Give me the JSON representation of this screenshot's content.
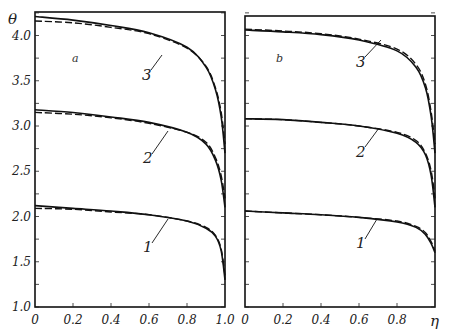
{
  "chart_data": [
    {
      "type": "line",
      "panel_label": "a",
      "xlabel": "",
      "ylabel": "θ",
      "xlim": [
        0,
        1.0
      ],
      "ylim": [
        1.0,
        4.3
      ],
      "x_ticks": [
        "0",
        "0.2",
        "0.4",
        "0.6",
        "0.8",
        "1.0"
      ],
      "y_ticks": [
        "1.0",
        "1.5",
        "2.0",
        "2.5",
        "3.0",
        "3.5",
        "4.0"
      ],
      "grid": false,
      "series": [
        {
          "name": "1 (solid)",
          "style": "solid",
          "x": [
            0,
            0.2,
            0.4,
            0.6,
            0.8,
            0.9,
            0.95,
            0.98,
            1.0
          ],
          "y": [
            2.12,
            2.09,
            2.06,
            2.02,
            1.95,
            1.87,
            1.78,
            1.62,
            1.3
          ]
        },
        {
          "name": "1 (dashed)",
          "style": "dashed",
          "x": [
            0,
            0.2,
            0.4,
            0.6,
            0.8,
            0.9,
            0.95,
            0.98,
            1.0
          ],
          "y": [
            2.09,
            2.08,
            2.05,
            2.02,
            1.95,
            1.88,
            1.79,
            1.64,
            1.35
          ]
        },
        {
          "name": "2 (solid)",
          "style": "solid",
          "x": [
            0,
            0.2,
            0.4,
            0.6,
            0.8,
            0.9,
            0.95,
            0.98,
            1.0
          ],
          "y": [
            3.18,
            3.15,
            3.1,
            3.04,
            2.93,
            2.8,
            2.62,
            2.4,
            2.1
          ]
        },
        {
          "name": "2 (dashed)",
          "style": "dashed",
          "x": [
            0,
            0.2,
            0.4,
            0.6,
            0.8,
            0.9,
            0.95,
            0.98,
            1.0
          ],
          "y": [
            3.15,
            3.13,
            3.09,
            3.03,
            2.93,
            2.82,
            2.65,
            2.45,
            2.2
          ]
        },
        {
          "name": "3 (solid)",
          "style": "solid",
          "x": [
            0,
            0.2,
            0.4,
            0.6,
            0.8,
            0.9,
            0.95,
            0.98,
            1.0
          ],
          "y": [
            4.21,
            4.17,
            4.11,
            4.03,
            3.87,
            3.65,
            3.4,
            3.1,
            2.7
          ]
        },
        {
          "name": "3 (dashed)",
          "style": "dashed",
          "x": [
            0,
            0.2,
            0.4,
            0.6,
            0.8,
            0.9,
            0.95,
            0.98,
            1.0
          ],
          "y": [
            4.16,
            4.14,
            4.09,
            4.02,
            3.86,
            3.66,
            3.42,
            3.15,
            2.8
          ]
        }
      ],
      "annotations": [
        "1",
        "2",
        "3",
        "a"
      ]
    },
    {
      "type": "line",
      "panel_label": "b",
      "xlabel": "η",
      "ylabel": "",
      "xlim": [
        0,
        1.0
      ],
      "ylim": [
        1.0,
        4.3
      ],
      "x_ticks": [
        "0",
        "0.2",
        "0.4",
        "0.6",
        "0.8"
      ],
      "y_ticks": [
        "1.0",
        "1.5",
        "2.0",
        "2.5",
        "3.0",
        "3.5",
        "4.0"
      ],
      "grid": false,
      "series": [
        {
          "name": "1 (solid)",
          "style": "solid",
          "x": [
            0,
            0.2,
            0.4,
            0.6,
            0.8,
            0.9,
            0.95,
            0.98,
            1.0
          ],
          "y": [
            2.06,
            2.04,
            2.02,
            1.99,
            1.94,
            1.88,
            1.8,
            1.7,
            1.6
          ]
        },
        {
          "name": "1 (dashed)",
          "style": "dashed",
          "x": [
            0,
            0.2,
            0.4,
            0.6,
            0.8,
            0.9,
            0.95,
            0.98,
            1.0
          ],
          "y": [
            2.06,
            2.04,
            2.02,
            1.99,
            1.95,
            1.89,
            1.82,
            1.72,
            1.62
          ]
        },
        {
          "name": "2 (solid)",
          "style": "solid",
          "x": [
            0,
            0.2,
            0.4,
            0.6,
            0.8,
            0.9,
            0.95,
            0.98,
            1.0
          ],
          "y": [
            3.08,
            3.07,
            3.04,
            3.0,
            2.92,
            2.82,
            2.68,
            2.45,
            2.1
          ]
        },
        {
          "name": "2 (dashed)",
          "style": "dashed",
          "x": [
            0,
            0.2,
            0.4,
            0.6,
            0.8,
            0.9,
            0.95,
            0.98,
            1.0
          ],
          "y": [
            3.08,
            3.07,
            3.04,
            3.0,
            2.93,
            2.84,
            2.7,
            2.5,
            2.2
          ]
        },
        {
          "name": "3 (solid)",
          "style": "solid",
          "x": [
            0,
            0.2,
            0.4,
            0.6,
            0.8,
            0.9,
            0.95,
            0.98,
            1.0
          ],
          "y": [
            4.06,
            4.04,
            4.01,
            3.95,
            3.83,
            3.65,
            3.42,
            3.1,
            2.7
          ]
        },
        {
          "name": "3 (dashed)",
          "style": "dashed",
          "x": [
            0,
            0.2,
            0.4,
            0.6,
            0.8,
            0.9,
            0.95,
            0.98,
            1.0
          ],
          "y": [
            4.07,
            4.05,
            4.02,
            3.96,
            3.85,
            3.68,
            3.46,
            3.15,
            2.8
          ]
        }
      ],
      "annotations": [
        "1",
        "2",
        "3",
        "b"
      ]
    }
  ],
  "labels": {
    "theta": "θ",
    "eta": "η",
    "panel_a": "a",
    "panel_b": "b",
    "curve_1": "1",
    "curve_2": "2",
    "curve_3": "3"
  },
  "ticks": {
    "y": [
      "1.0",
      "1.5",
      "2.0",
      "2.5",
      "3.0",
      "3.5",
      "4.0"
    ],
    "x_left": [
      "0",
      "0.2",
      "0.4",
      "0.6",
      "0.8",
      "1.0"
    ],
    "x_right": [
      "0",
      "0.2",
      "0.4",
      "0.6",
      "0.8"
    ]
  }
}
